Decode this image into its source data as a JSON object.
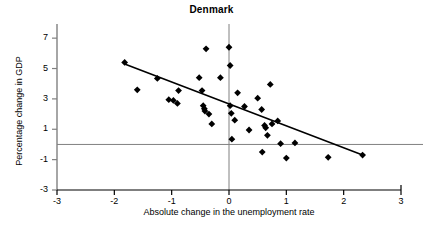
{
  "chart_data": {
    "type": "scatter",
    "title": "Denmark",
    "xlabel": "Absolute change in the unemployment rate",
    "ylabel": "Percentage change in GDP",
    "xlim": [
      -3,
      3
    ],
    "ylim": [
      -3,
      7.8
    ],
    "xticks": [
      -3,
      -2,
      -1,
      0,
      1,
      2,
      3
    ],
    "xtick_labels": [
      "-3",
      "-2",
      "-1",
      "0",
      "1",
      "2",
      "3"
    ],
    "yticks": [
      7,
      5,
      3,
      1,
      -1,
      -3
    ],
    "ytick_labels": [
      "7",
      "5",
      "3",
      "1",
      "-1",
      "-3"
    ],
    "grid": false,
    "legend": null,
    "marker": "diamond",
    "marker_color": "#000000",
    "reference_lines": [
      {
        "name": "zero-horizontal",
        "orientation": "horizontal",
        "value": 0,
        "color": "#808080"
      },
      {
        "name": "zero-vertical",
        "orientation": "vertical",
        "value": 0,
        "color": "#808080"
      }
    ],
    "trend_line": {
      "name": "regression-line",
      "color": "#000000",
      "x_start": -1.82,
      "y_start": 5.3,
      "x_end": 2.33,
      "y_end": -0.7
    },
    "points": [
      {
        "x": -1.82,
        "y": 5.4
      },
      {
        "x": -1.6,
        "y": 3.6
      },
      {
        "x": -1.25,
        "y": 4.35
      },
      {
        "x": -1.05,
        "y": 2.95
      },
      {
        "x": -0.97,
        "y": 2.9
      },
      {
        "x": -0.9,
        "y": 2.7
      },
      {
        "x": -0.88,
        "y": 3.55
      },
      {
        "x": -0.52,
        "y": 4.4
      },
      {
        "x": -0.47,
        "y": 3.55
      },
      {
        "x": -0.45,
        "y": 2.55
      },
      {
        "x": -0.43,
        "y": 2.35
      },
      {
        "x": -0.42,
        "y": 2.2
      },
      {
        "x": -0.4,
        "y": 6.3
      },
      {
        "x": -0.35,
        "y": 2.0
      },
      {
        "x": -0.3,
        "y": 1.35
      },
      {
        "x": -0.15,
        "y": 4.4
      },
      {
        "x": 0.0,
        "y": 6.4
      },
      {
        "x": 0.02,
        "y": 5.2
      },
      {
        "x": 0.02,
        "y": 2.55
      },
      {
        "x": 0.04,
        "y": 2.05
      },
      {
        "x": 0.05,
        "y": 0.35
      },
      {
        "x": 0.1,
        "y": 1.6
      },
      {
        "x": 0.15,
        "y": 3.4
      },
      {
        "x": 0.27,
        "y": 2.5
      },
      {
        "x": 0.35,
        "y": 0.95
      },
      {
        "x": 0.5,
        "y": 3.05
      },
      {
        "x": 0.57,
        "y": 2.3
      },
      {
        "x": 0.58,
        "y": -0.5
      },
      {
        "x": 0.62,
        "y": 1.25
      },
      {
        "x": 0.64,
        "y": 1.1
      },
      {
        "x": 0.67,
        "y": 0.6
      },
      {
        "x": 0.72,
        "y": 3.95
      },
      {
        "x": 0.75,
        "y": 1.35
      },
      {
        "x": 0.85,
        "y": 1.55
      },
      {
        "x": 0.9,
        "y": 0.05
      },
      {
        "x": 1.0,
        "y": -0.9
      },
      {
        "x": 1.15,
        "y": 0.1
      },
      {
        "x": 1.73,
        "y": -0.85
      },
      {
        "x": 2.33,
        "y": -0.7
      }
    ]
  }
}
